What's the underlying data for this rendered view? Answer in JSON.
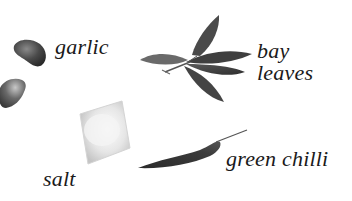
{
  "figure": {
    "background": "#ffffff",
    "ink_color": "#1a1a1a",
    "items": [
      {
        "id": "garlic",
        "label": "garlic",
        "icon": "garlic-clove-icon"
      },
      {
        "id": "bay-leaves",
        "label_line1": "bay",
        "label_line2": "leaves",
        "icon": "bay-leaf-icon"
      },
      {
        "id": "salt",
        "label": "salt",
        "icon": "salt-cube-icon"
      },
      {
        "id": "green-chilli",
        "label": "green chilli",
        "icon": "chilli-pepper-icon"
      }
    ]
  }
}
